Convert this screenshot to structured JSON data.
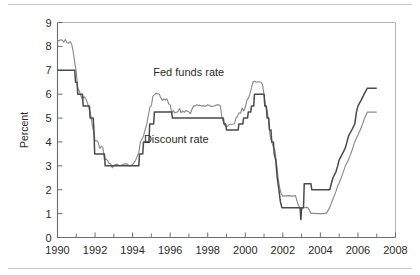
{
  "chart_data": {
    "type": "line",
    "title": "",
    "xlabel": "",
    "ylabel": "Percent",
    "xlim": [
      1990,
      2008
    ],
    "ylim": [
      0,
      9
    ],
    "grid": false,
    "legend_position": "inline-annotations",
    "y_ticks": [
      "0",
      "1",
      "2",
      "3",
      "4",
      "5",
      "6",
      "7",
      "8",
      "9"
    ],
    "x_ticks": [
      "1990",
      "1992",
      "1994",
      "1996",
      "1998",
      "2000",
      "2002",
      "2004",
      "2006",
      "2008"
    ],
    "x_minor_ticks": [
      "1991",
      "1993",
      "1995",
      "1997",
      "1999",
      "2001",
      "2003",
      "2005",
      "2007"
    ],
    "annotations": [
      {
        "text": "Fed funds rate",
        "x": 1995.1,
        "y": 6.75
      },
      {
        "text": "Discount rate",
        "x": 1994.6,
        "y": 3.95
      }
    ],
    "series": [
      {
        "name": "Fed funds rate",
        "color": "#8c8c8c",
        "width": 1.15,
        "points": [
          [
            1990.0,
            8.23
          ],
          [
            1990.08,
            8.24
          ],
          [
            1990.17,
            8.28
          ],
          [
            1990.25,
            8.26
          ],
          [
            1990.33,
            8.18
          ],
          [
            1990.42,
            8.29
          ],
          [
            1990.5,
            8.15
          ],
          [
            1990.58,
            8.13
          ],
          [
            1990.67,
            8.2
          ],
          [
            1990.75,
            8.11
          ],
          [
            1990.83,
            7.81
          ],
          [
            1990.92,
            7.31
          ],
          [
            1991.0,
            6.91
          ],
          [
            1991.08,
            6.25
          ],
          [
            1991.17,
            6.12
          ],
          [
            1991.25,
            5.91
          ],
          [
            1991.33,
            5.78
          ],
          [
            1991.42,
            5.9
          ],
          [
            1991.5,
            5.82
          ],
          [
            1991.58,
            5.66
          ],
          [
            1991.67,
            5.45
          ],
          [
            1991.75,
            5.21
          ],
          [
            1991.83,
            4.81
          ],
          [
            1991.92,
            4.43
          ],
          [
            1992.0,
            4.03
          ],
          [
            1992.08,
            4.06
          ],
          [
            1992.17,
            3.98
          ],
          [
            1992.25,
            3.73
          ],
          [
            1992.33,
            3.82
          ],
          [
            1992.42,
            3.76
          ],
          [
            1992.5,
            3.25
          ],
          [
            1992.58,
            3.3
          ],
          [
            1992.67,
            3.22
          ],
          [
            1992.75,
            3.1
          ],
          [
            1992.83,
            3.09
          ],
          [
            1992.92,
            2.92
          ],
          [
            1993.0,
            3.02
          ],
          [
            1993.17,
            3.07
          ],
          [
            1993.33,
            3.0
          ],
          [
            1993.5,
            3.06
          ],
          [
            1993.67,
            3.09
          ],
          [
            1993.83,
            2.99
          ],
          [
            1994.0,
            3.05
          ],
          [
            1994.17,
            3.25
          ],
          [
            1994.33,
            3.56
          ],
          [
            1994.42,
            4.01
          ],
          [
            1994.58,
            4.25
          ],
          [
            1994.75,
            4.75
          ],
          [
            1994.92,
            5.45
          ],
          [
            1995.0,
            5.53
          ],
          [
            1995.08,
            5.92
          ],
          [
            1995.17,
            5.98
          ],
          [
            1995.25,
            6.05
          ],
          [
            1995.33,
            6.01
          ],
          [
            1995.42,
            6.0
          ],
          [
            1995.5,
            5.85
          ],
          [
            1995.58,
            5.74
          ],
          [
            1995.67,
            5.8
          ],
          [
            1995.75,
            5.76
          ],
          [
            1995.83,
            5.8
          ],
          [
            1995.92,
            5.6
          ],
          [
            1996.0,
            5.56
          ],
          [
            1996.08,
            5.22
          ],
          [
            1996.17,
            5.31
          ],
          [
            1996.25,
            5.22
          ],
          [
            1996.33,
            5.24
          ],
          [
            1996.42,
            5.27
          ],
          [
            1996.5,
            5.4
          ],
          [
            1996.58,
            5.22
          ],
          [
            1996.67,
            5.3
          ],
          [
            1996.75,
            5.24
          ],
          [
            1996.83,
            5.31
          ],
          [
            1996.92,
            5.29
          ],
          [
            1997.0,
            5.25
          ],
          [
            1997.08,
            5.19
          ],
          [
            1997.17,
            5.39
          ],
          [
            1997.25,
            5.51
          ],
          [
            1997.33,
            5.5
          ],
          [
            1997.42,
            5.56
          ],
          [
            1997.5,
            5.52
          ],
          [
            1997.58,
            5.54
          ],
          [
            1997.67,
            5.5
          ],
          [
            1997.75,
            5.52
          ],
          [
            1997.83,
            5.5
          ],
          [
            1997.92,
            5.5
          ],
          [
            1998.0,
            5.56
          ],
          [
            1998.17,
            5.49
          ],
          [
            1998.33,
            5.5
          ],
          [
            1998.5,
            5.56
          ],
          [
            1998.58,
            5.55
          ],
          [
            1998.67,
            5.51
          ],
          [
            1998.75,
            5.07
          ],
          [
            1998.83,
            4.83
          ],
          [
            1998.92,
            4.68
          ],
          [
            1999.0,
            4.63
          ],
          [
            1999.17,
            4.74
          ],
          [
            1999.33,
            4.74
          ],
          [
            1999.42,
            4.76
          ],
          [
            1999.5,
            5.0
          ],
          [
            1999.58,
            5.07
          ],
          [
            1999.67,
            5.22
          ],
          [
            1999.75,
            5.2
          ],
          [
            1999.83,
            5.42
          ],
          [
            1999.92,
            5.3
          ],
          [
            2000.0,
            5.45
          ],
          [
            2000.08,
            5.73
          ],
          [
            2000.17,
            5.85
          ],
          [
            2000.25,
            6.02
          ],
          [
            2000.33,
            6.27
          ],
          [
            2000.42,
            6.53
          ],
          [
            2000.5,
            6.54
          ],
          [
            2000.58,
            6.5
          ],
          [
            2000.67,
            6.52
          ],
          [
            2000.75,
            6.51
          ],
          [
            2000.83,
            6.51
          ],
          [
            2000.92,
            6.4
          ],
          [
            2001.0,
            5.98
          ],
          [
            2001.08,
            5.49
          ],
          [
            2001.17,
            5.31
          ],
          [
            2001.25,
            4.8
          ],
          [
            2001.33,
            4.21
          ],
          [
            2001.42,
            3.97
          ],
          [
            2001.5,
            3.77
          ],
          [
            2001.58,
            3.65
          ],
          [
            2001.67,
            3.07
          ],
          [
            2001.75,
            2.49
          ],
          [
            2001.83,
            2.09
          ],
          [
            2001.92,
            1.82
          ],
          [
            2002.0,
            1.73
          ],
          [
            2002.17,
            1.74
          ],
          [
            2002.33,
            1.75
          ],
          [
            2002.5,
            1.73
          ],
          [
            2002.67,
            1.75
          ],
          [
            2002.83,
            1.34
          ],
          [
            2002.92,
            1.24
          ],
          [
            2003.0,
            1.24
          ],
          [
            2003.17,
            1.25
          ],
          [
            2003.33,
            1.26
          ],
          [
            2003.5,
            1.01
          ],
          [
            2003.67,
            1.01
          ],
          [
            2003.83,
            1.0
          ],
          [
            2004.0,
            1.0
          ],
          [
            2004.17,
            1.0
          ],
          [
            2004.33,
            1.03
          ],
          [
            2004.5,
            1.26
          ],
          [
            2004.58,
            1.43
          ],
          [
            2004.67,
            1.61
          ],
          [
            2004.83,
            1.93
          ],
          [
            2004.92,
            2.16
          ],
          [
            2005.0,
            2.28
          ],
          [
            2005.17,
            2.63
          ],
          [
            2005.33,
            3.0
          ],
          [
            2005.5,
            3.26
          ],
          [
            2005.67,
            3.62
          ],
          [
            2005.83,
            4.0
          ],
          [
            2005.92,
            4.16
          ],
          [
            2006.0,
            4.29
          ],
          [
            2006.17,
            4.59
          ],
          [
            2006.33,
            4.94
          ],
          [
            2006.5,
            5.25
          ],
          [
            2006.67,
            5.25
          ],
          [
            2006.83,
            5.25
          ],
          [
            2007.0,
            5.25
          ]
        ]
      },
      {
        "name": "Discount rate",
        "color": "#4a4a4a",
        "width": 1.5,
        "points": [
          [
            1990.0,
            7.0
          ],
          [
            1990.92,
            7.0
          ],
          [
            1990.96,
            6.5
          ],
          [
            1991.04,
            6.5
          ],
          [
            1991.08,
            6.0
          ],
          [
            1991.33,
            6.0
          ],
          [
            1991.37,
            5.5
          ],
          [
            1991.7,
            5.5
          ],
          [
            1991.74,
            5.0
          ],
          [
            1991.9,
            5.0
          ],
          [
            1991.94,
            4.5
          ],
          [
            1991.98,
            3.5
          ],
          [
            1992.5,
            3.5
          ],
          [
            1992.54,
            3.0
          ],
          [
            1994.33,
            3.0
          ],
          [
            1994.37,
            3.5
          ],
          [
            1994.54,
            3.5
          ],
          [
            1994.58,
            4.0
          ],
          [
            1994.87,
            4.0
          ],
          [
            1994.91,
            4.75
          ],
          [
            1995.12,
            4.75
          ],
          [
            1995.16,
            5.25
          ],
          [
            1996.08,
            5.25
          ],
          [
            1996.12,
            5.0
          ],
          [
            1998.83,
            5.0
          ],
          [
            1998.87,
            4.75
          ],
          [
            1998.96,
            4.75
          ],
          [
            1999.0,
            4.5
          ],
          [
            1999.62,
            4.5
          ],
          [
            1999.66,
            4.75
          ],
          [
            1999.87,
            4.75
          ],
          [
            1999.91,
            5.0
          ],
          [
            2000.12,
            5.0
          ],
          [
            2000.16,
            5.25
          ],
          [
            2000.29,
            5.25
          ],
          [
            2000.33,
            5.5
          ],
          [
            2000.45,
            5.5
          ],
          [
            2000.49,
            6.0
          ],
          [
            2001.0,
            6.0
          ],
          [
            2001.04,
            5.5
          ],
          [
            2001.12,
            5.5
          ],
          [
            2001.16,
            5.0
          ],
          [
            2001.25,
            5.0
          ],
          [
            2001.29,
            4.5
          ],
          [
            2001.37,
            4.5
          ],
          [
            2001.41,
            4.0
          ],
          [
            2001.5,
            4.0
          ],
          [
            2001.54,
            3.5
          ],
          [
            2001.62,
            3.25
          ],
          [
            2001.7,
            2.5
          ],
          [
            2001.79,
            2.0
          ],
          [
            2001.87,
            1.5
          ],
          [
            2001.95,
            1.25
          ],
          [
            2002.0,
            1.25
          ],
          [
            2002.92,
            1.25
          ],
          [
            2002.96,
            0.75
          ],
          [
            2003.0,
            1.25
          ],
          [
            2003.1,
            1.25
          ],
          [
            2003.14,
            2.25
          ],
          [
            2003.25,
            2.25
          ],
          [
            2003.5,
            2.25
          ],
          [
            2003.54,
            2.0
          ],
          [
            2004.5,
            2.0
          ],
          [
            2004.58,
            2.25
          ],
          [
            2004.67,
            2.5
          ],
          [
            2004.83,
            2.75
          ],
          [
            2004.92,
            3.0
          ],
          [
            2005.0,
            3.25
          ],
          [
            2005.17,
            3.5
          ],
          [
            2005.33,
            3.75
          ],
          [
            2005.5,
            4.25
          ],
          [
            2005.67,
            4.5
          ],
          [
            2005.83,
            4.75
          ],
          [
            2005.92,
            5.25
          ],
          [
            2006.0,
            5.5
          ],
          [
            2006.17,
            5.75
          ],
          [
            2006.33,
            6.0
          ],
          [
            2006.5,
            6.25
          ],
          [
            2006.67,
            6.25
          ],
          [
            2006.83,
            6.25
          ],
          [
            2007.0,
            6.25
          ]
        ]
      }
    ]
  }
}
